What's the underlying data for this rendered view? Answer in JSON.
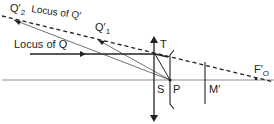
{
  "diagram": {
    "labels": {
      "q2_main": "Q′",
      "q2_sub": "2",
      "locus_q_prime": "Locus of Q′",
      "q1_main": "Q′",
      "q1_sub": "1",
      "locus_q": "Locus of Q",
      "t": "T",
      "s": "S",
      "p": "P",
      "m_prime": "M′",
      "fo_main": "F′",
      "fo_sub": "O"
    },
    "colors": {
      "ink": "#222222",
      "background": "#ffffff"
    }
  }
}
